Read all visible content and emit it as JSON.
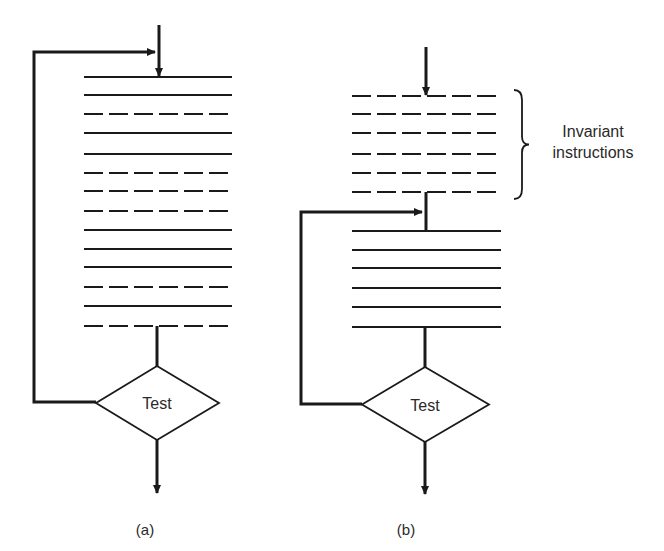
{
  "figure": {
    "panels": [
      {
        "id": "a",
        "caption": "(a)",
        "caption_pos": [
          145,
          535
        ],
        "instructions": {
          "x1": 84,
          "x2": 232,
          "rows": [
            {
              "y": 77,
              "style": "solid"
            },
            {
              "y": 95,
              "style": "solid"
            },
            {
              "y": 114,
              "style": "dashed"
            },
            {
              "y": 133,
              "style": "solid"
            },
            {
              "y": 154,
              "style": "solid"
            },
            {
              "y": 173,
              "style": "dashed"
            },
            {
              "y": 191,
              "style": "dashed"
            },
            {
              "y": 211,
              "style": "dashed"
            },
            {
              "y": 230,
              "style": "solid"
            },
            {
              "y": 249,
              "style": "solid"
            },
            {
              "y": 267,
              "style": "solid"
            },
            {
              "y": 287,
              "style": "dashed"
            },
            {
              "y": 306,
              "style": "solid"
            },
            {
              "y": 326,
              "style": "dashed"
            }
          ]
        },
        "entry_arrow": {
          "x": 159,
          "y1": 25,
          "y2": 77
        },
        "loop": {
          "x_left": 34,
          "y_top": 52,
          "x_target": 157,
          "y_return": 402
        },
        "test": {
          "label": "Test",
          "cx": 157,
          "top": 366,
          "bottom": 440,
          "left": 96,
          "right": 219
        },
        "exit_arrow": {
          "x": 157,
          "y1": 440,
          "y2": 493
        }
      },
      {
        "id": "b",
        "caption": "(b)",
        "caption_pos": [
          406,
          535
        ],
        "invariant_block": {
          "x1": 352,
          "x2": 501,
          "rows": [
            {
              "y": 96,
              "style": "dashed"
            },
            {
              "y": 114,
              "style": "dashed"
            },
            {
              "y": 133,
              "style": "dashed"
            },
            {
              "y": 154,
              "style": "dashed"
            },
            {
              "y": 173,
              "style": "dashed"
            },
            {
              "y": 192,
              "style": "dashed"
            }
          ]
        },
        "instructions": {
          "x1": 352,
          "x2": 501,
          "rows": [
            {
              "y": 231,
              "style": "solid"
            },
            {
              "y": 250,
              "style": "solid"
            },
            {
              "y": 268,
              "style": "solid"
            },
            {
              "y": 288,
              "style": "solid"
            },
            {
              "y": 307,
              "style": "solid"
            },
            {
              "y": 327,
              "style": "solid"
            }
          ]
        },
        "entry_arrow": {
          "x": 426,
          "y1": 47,
          "y2": 96
        },
        "connector": {
          "x": 426,
          "y1": 192,
          "y2": 231
        },
        "loop": {
          "x_left": 301,
          "y_top": 212,
          "x_target": 424,
          "y_return": 404
        },
        "test": {
          "label": "Test",
          "cx": 425,
          "top": 367,
          "bottom": 442,
          "left": 362,
          "right": 489
        },
        "exit_arrow": {
          "x": 425,
          "y1": 442,
          "y2": 494
        },
        "annotation": {
          "lines": [
            "Invariant",
            "instructions"
          ],
          "brace": {
            "x": 514,
            "y1": 90,
            "y2": 199
          },
          "text_x": 593,
          "text_y": [
            137,
            158
          ]
        }
      }
    ]
  }
}
